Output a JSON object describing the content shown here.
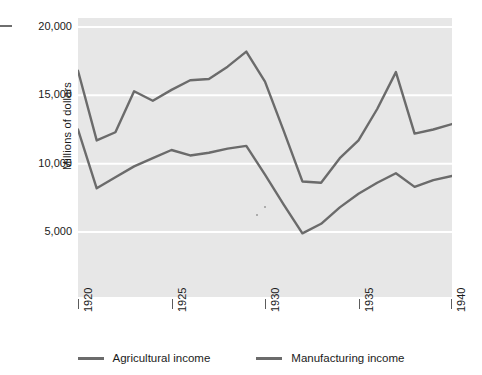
{
  "chart_data": {
    "type": "line",
    "title": "",
    "xlabel": "",
    "ylabel": "Millions of dollars",
    "xlim": [
      1920,
      1940
    ],
    "ylim": [
      0,
      20000
    ],
    "grid": true,
    "legend_position": "bottom",
    "x_ticks": [
      1920,
      1925,
      1930,
      1935,
      1940
    ],
    "x_tick_labels": [
      "1920",
      "1925",
      "1930",
      "1935",
      "1940"
    ],
    "y_ticks": [
      5000,
      10000,
      15000,
      20000
    ],
    "y_tick_labels": [
      "5,000",
      "10,000",
      "15,000",
      "20,000"
    ],
    "x": [
      1920,
      1921,
      1922,
      1923,
      1924,
      1925,
      1926,
      1927,
      1928,
      1929,
      1930,
      1931,
      1932,
      1933,
      1934,
      1935,
      1936,
      1937,
      1938,
      1939,
      1940
    ],
    "series": [
      {
        "name": "Agricultural income",
        "color": "#6b6b6b",
        "values": [
          12500,
          8200,
          9000,
          9800,
          10400,
          11000,
          10600,
          10800,
          11100,
          11300,
          9200,
          7000,
          4900,
          5600,
          6800,
          7800,
          8600,
          9300,
          8300,
          8800,
          9100
        ]
      },
      {
        "name": "Manufacturing income",
        "color": "#6b6b6b",
        "values": [
          16800,
          11700,
          12300,
          15300,
          14600,
          15400,
          16100,
          16200,
          17100,
          18200,
          16000,
          12400,
          8700,
          8600,
          10400,
          11700,
          14000,
          16700,
          12200,
          12500,
          12900
        ]
      }
    ]
  },
  "legend": {
    "entries": [
      {
        "label": "Agricultural income"
      },
      {
        "label": "Manufacturing income"
      }
    ]
  },
  "axes": {
    "y_title": "Millions of dollars"
  }
}
